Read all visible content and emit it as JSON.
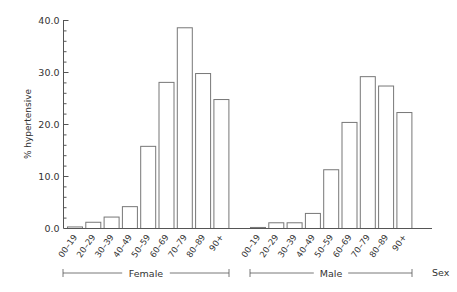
{
  "chart_data": {
    "type": "bar",
    "title": "",
    "xlabel": "Sex",
    "ylabel": "% hypertensive",
    "ylim": [
      0,
      40
    ],
    "yticks": [
      "0.0",
      "10.0",
      "20.0",
      "30.0",
      "40.0"
    ],
    "grid": false,
    "legend": "none",
    "categories": [
      "00–19",
      "20–29",
      "30–39",
      "40–49",
      "50–59",
      "60–69",
      "70–79",
      "80–89",
      "90+"
    ],
    "groups": [
      "Female",
      "Male"
    ],
    "series": [
      {
        "name": "Female",
        "values": [
          0.3,
          1.2,
          2.2,
          4.2,
          15.8,
          28.1,
          38.6,
          29.8,
          24.8
        ]
      },
      {
        "name": "Male",
        "values": [
          0.2,
          1.1,
          1.1,
          2.9,
          11.3,
          20.4,
          29.2,
          27.4,
          22.3
        ]
      }
    ]
  },
  "colors": {
    "bar_fill": "#ffffff",
    "bar_stroke": "#777777",
    "axis": "#555555",
    "text": "#333333"
  }
}
